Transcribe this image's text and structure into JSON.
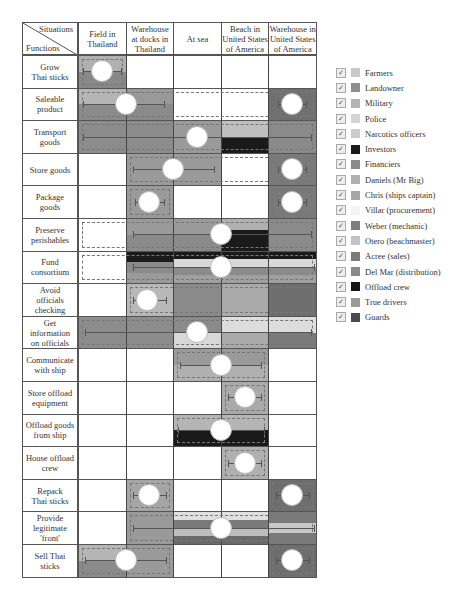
{
  "header": {
    "corner_top": "Situations",
    "corner_bottom": "Functions",
    "columns": [
      "Field in\nThailand",
      "Warehouse\nat docks in\nThailand",
      "At sea",
      "Beach in\nUnited States\nof America",
      "Warehouse in\nUnited States\nof America"
    ]
  },
  "rows": [
    {
      "label": "Grow\nThai sticks",
      "bands": [
        {
          "from": 0,
          "to": 1,
          "colors": [
            "#b0b0b0",
            "#888888"
          ]
        }
      ],
      "bar": [
        0.1,
        0.9
      ],
      "circle": 0.5,
      "dashed": [
        0,
        1
      ]
    },
    {
      "label": "Saleable\nproduct",
      "bands": [
        {
          "from": 0,
          "to": 1,
          "colors": [
            "#b5b5b5",
            "#8a8a8a"
          ]
        },
        {
          "from": 1,
          "to": 2,
          "colors": [
            "#999999",
            "#8a8a8a"
          ]
        },
        {
          "from": 4,
          "to": 5,
          "colors": [
            "#707070"
          ]
        }
      ],
      "bar": [
        0.1,
        1.8
      ],
      "circle": 1.0,
      "bar2": [
        4.2,
        4.8
      ],
      "circle2": 4.5,
      "dashed": [
        0,
        5
      ]
    },
    {
      "label": "Transport\ngoods",
      "bands": [
        {
          "from": 0,
          "to": 2,
          "colors": [
            "#8c8c8c"
          ]
        },
        {
          "from": 2,
          "to": 3,
          "colors": [
            "#9a9a9a"
          ]
        },
        {
          "from": 3,
          "to": 4,
          "colors": [
            "#bfbfbf",
            "#1a1a1a"
          ]
        },
        {
          "from": 4,
          "to": 5,
          "colors": [
            "#8a8a8a"
          ]
        }
      ],
      "bar": [
        0.1,
        4.9
      ],
      "circle": 2.5,
      "dashed": [
        0,
        5
      ]
    },
    {
      "label": "Store goods",
      "bands": [
        {
          "from": 1,
          "to": 3,
          "colors": [
            "#9a9a9a"
          ]
        },
        {
          "from": 4,
          "to": 5,
          "colors": [
            "#7a7a7a"
          ]
        }
      ],
      "bar": [
        1.15,
        2.85
      ],
      "circle": 2.0,
      "bar2": [
        4.2,
        4.8
      ],
      "circle2": 4.5,
      "dashed": [
        1,
        5
      ]
    },
    {
      "label": "Package\ngoods",
      "bands": [
        {
          "from": 1,
          "to": 2,
          "colors": [
            "#9a9a9a"
          ]
        },
        {
          "from": 4,
          "to": 5,
          "colors": [
            "#7a7a7a"
          ]
        }
      ],
      "bar": [
        1.2,
        1.8
      ],
      "circle": 1.5,
      "bar2": [
        4.2,
        4.8
      ],
      "circle2": 4.5,
      "dashed": [
        1,
        2
      ],
      "dashed2": [
        4,
        5
      ]
    },
    {
      "label": "Preserve\nperishables",
      "bands": [
        {
          "from": 1,
          "to": 3,
          "colors": [
            "#9a9a9a",
            "#8a8a8a"
          ]
        },
        {
          "from": 3,
          "to": 4,
          "colors": [
            "#b0b0b0",
            "#1a1a1a",
            "#1a1a1a"
          ]
        },
        {
          "from": 4,
          "to": 5,
          "colors": [
            "#8a8a8a"
          ]
        }
      ],
      "bar": [
        1.15,
        4.9
      ],
      "circle": 3.0,
      "dashed": [
        0,
        5
      ]
    },
    {
      "label": "Fund\nconsortium",
      "bands": [
        {
          "from": 1,
          "to": 2,
          "colors": [
            "#1a1a1a",
            "#8a8a8a",
            "#9a9a9a"
          ]
        },
        {
          "from": 2,
          "to": 5,
          "colors": [
            "#1a1a1a",
            "#d8d8d8",
            "#8a8a8a",
            "#a0a0a0"
          ]
        }
      ],
      "bar": [
        1.15,
        4.95
      ],
      "circle": 3.0,
      "dashed": [
        0,
        5
      ]
    },
    {
      "label": "Avoid\nofficials\nchecking",
      "bands": [
        {
          "from": 1,
          "to": 2,
          "colors": [
            "#b8b8b8"
          ]
        },
        {
          "from": 2,
          "to": 3,
          "colors": [
            "#8a8a8a"
          ]
        },
        {
          "from": 3,
          "to": 4,
          "colors": [
            "#aaaaaa"
          ]
        },
        {
          "from": 4,
          "to": 5,
          "colors": [
            "#6e6e6e"
          ]
        }
      ],
      "bar": [
        1.15,
        1.85
      ],
      "circle": 1.45,
      "dashed": [
        1,
        5
      ]
    },
    {
      "label": "Get\ninformation\non officials",
      "bands": [
        {
          "from": 0,
          "to": 2,
          "colors": [
            "#8c8c8c"
          ]
        },
        {
          "from": 2,
          "to": 3,
          "colors": [
            "#8a8a8a",
            "#d8d8d8"
          ]
        },
        {
          "from": 3,
          "to": 4,
          "colors": [
            "#dddddd",
            "#aaaaaa"
          ]
        },
        {
          "from": 4,
          "to": 5,
          "colors": [
            "#dddddd",
            "#7a7a7a"
          ]
        }
      ],
      "bar": [
        0.15,
        4.9
      ],
      "circle": 2.5,
      "dashed": [
        0,
        5
      ]
    },
    {
      "label": "Communicate\nwith ship",
      "bands": [
        {
          "from": 2,
          "to": 4,
          "colors": [
            "#9a9a9a",
            "#b0b0b0"
          ]
        }
      ],
      "bar": [
        2.15,
        3.85
      ],
      "circle": 3.0,
      "dashed": [
        2,
        4
      ]
    },
    {
      "label": "Store offload\nequipment",
      "bands": [
        {
          "from": 3,
          "to": 4,
          "colors": [
            "#aaaaaa"
          ]
        }
      ],
      "bar": [
        3.15,
        3.85
      ],
      "circle": 3.5,
      "dashed": [
        3,
        4
      ]
    },
    {
      "label": "Offload goods\nfrom ship",
      "bands": [
        {
          "from": 2,
          "to": 4,
          "colors": [
            "#b5b5b5",
            "#1a1a1a"
          ]
        }
      ],
      "bar": [
        2.1,
        3.9
      ],
      "circle": 3.0,
      "dashed": [
        2,
        4
      ]
    },
    {
      "label": "House offload\ncrew",
      "bands": [
        {
          "from": 3,
          "to": 4,
          "colors": [
            "#b0b0b0"
          ]
        }
      ],
      "bar": [
        3.15,
        3.85
      ],
      "circle": 3.5,
      "dashed": [
        3,
        4
      ]
    },
    {
      "label": "Repack\nThai sticks",
      "bands": [
        {
          "from": 1,
          "to": 2,
          "colors": [
            "#a5a5a5"
          ]
        },
        {
          "from": 4,
          "to": 5,
          "colors": [
            "#6e6e6e"
          ]
        }
      ],
      "bar": [
        1.15,
        1.85
      ],
      "circle": 1.5,
      "bar2": [
        4.15,
        4.85
      ],
      "circle2": 4.5,
      "dashed": [
        1,
        2
      ],
      "dashed2": [
        4,
        5
      ]
    },
    {
      "label": "Provide\nlegitimate\n'front'",
      "bands": [
        {
          "from": 1,
          "to": 2,
          "colors": [
            "#9a9a9a"
          ]
        },
        {
          "from": 2,
          "to": 4,
          "colors": [
            "#e0e0e0",
            "#7a7a7a",
            "#bcbcbc",
            "#6a6a6a"
          ]
        },
        {
          "from": 4,
          "to": 5,
          "colors": [
            "#7a7a7a",
            "#c8c8c8",
            "#7a7a7a"
          ]
        }
      ],
      "bar": [
        1.15,
        4.95
      ],
      "circle": 3.0,
      "dashed": [
        1,
        5
      ]
    },
    {
      "label": "Sell Thai\nsticks",
      "bands": [
        {
          "from": 0,
          "to": 1,
          "colors": [
            "#b5b5b5",
            "#8a8a8a"
          ]
        },
        {
          "from": 1,
          "to": 2,
          "colors": [
            "#9a9a9a"
          ]
        },
        {
          "from": 4,
          "to": 5,
          "colors": [
            "#6e6e6e"
          ]
        }
      ],
      "bar": [
        0.15,
        1.85
      ],
      "circle": 1.0,
      "bar2": [
        4.15,
        4.85
      ],
      "circle2": 4.5,
      "dashed": [
        0,
        2
      ],
      "dashed2": [
        4,
        5
      ]
    }
  ],
  "legend": {
    "items": [
      {
        "label": "Farmers",
        "color": "#c8c8c8",
        "checked": true
      },
      {
        "label": "Landowner",
        "color": "#8e8e8e",
        "checked": true
      },
      {
        "label": "Military",
        "color": "#b4b4b4",
        "checked": true
      },
      {
        "label": "Police",
        "color": "#d4d4d4",
        "checked": true
      },
      {
        "label": "Narcotics officers",
        "color": "#cccccc",
        "checked": true
      },
      {
        "label": "Investors",
        "color": "#1a1a1a",
        "checked": true
      },
      {
        "label": "Financiers",
        "color": "#8a8a8a",
        "checked": true
      },
      {
        "label": "Daniels (Mr Big)",
        "color": "#b0b0b0",
        "checked": true
      },
      {
        "label": "Chris (ships captain)",
        "color": "#a6a6a6",
        "checked": true
      },
      {
        "label": "Villar (procurement)",
        "color": "#f4f4f4",
        "checked": true
      },
      {
        "label": "Weber (mechanic)",
        "color": "#7e7e7e",
        "checked": true
      },
      {
        "label": "Otero (beachmaster)",
        "color": "#c4c4c4",
        "checked": true
      },
      {
        "label": "Acree (sales)",
        "color": "#7a7a7a",
        "checked": true
      },
      {
        "label": "Del Mar (distribution)",
        "color": "#8a8a8a",
        "checked": true
      },
      {
        "label": "Offload crew",
        "color": "#151515",
        "checked": true
      },
      {
        "label": "True drivers",
        "color": "#9a9a9a",
        "checked": true
      },
      {
        "label": "Guards",
        "color": "#4a4a4a",
        "checked": true
      }
    ]
  }
}
